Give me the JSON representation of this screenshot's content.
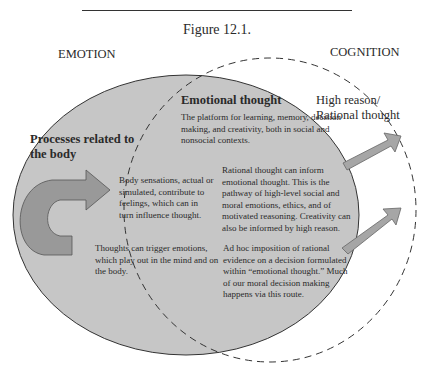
{
  "figure": {
    "title": "Figure 12.1.",
    "circles": {
      "emotion": {
        "label": "EMOTION",
        "fill": "#c6c6c6",
        "stroke": "#333333",
        "style": "solid"
      },
      "cognition": {
        "label": "COGNITION",
        "fill": "none",
        "stroke": "#333333",
        "style": "dashed"
      }
    },
    "regions": {
      "body": {
        "heading": "Processes related to the body"
      },
      "emotional_thought": {
        "heading": "Emotional thought",
        "text": "The platform for learning, memory, decision making, and creativity, both in social and nonsocial contexts."
      },
      "high_reason": {
        "heading": "High reason/ Rational thought"
      }
    },
    "annotations": {
      "body_sensations": "Body sensations, actual or simulated, contribute to feelings, which can in turn influence thought.",
      "thoughts_trigger": "Thoughts can trigger emotions, which play out in the mind and on the body.",
      "rational_inform": "Rational thought can inform emotional thought. This is the pathway of high-level social and moral emotions, ethics, and of motivated reasoning. Creativity can also be informed by high reason.",
      "ad_hoc": "Ad hoc imposition of rational evidence on a decision formulated within “emotional thought.” Much of our moral decision making happens via this route."
    },
    "arrows": [
      {
        "name": "body-loop-arrow",
        "color": "#999999"
      },
      {
        "name": "rational-to-emotional-arrow",
        "color": "#a6a6a6"
      },
      {
        "name": "adhoc-arrow",
        "color": "#a6a6a6"
      }
    ]
  }
}
